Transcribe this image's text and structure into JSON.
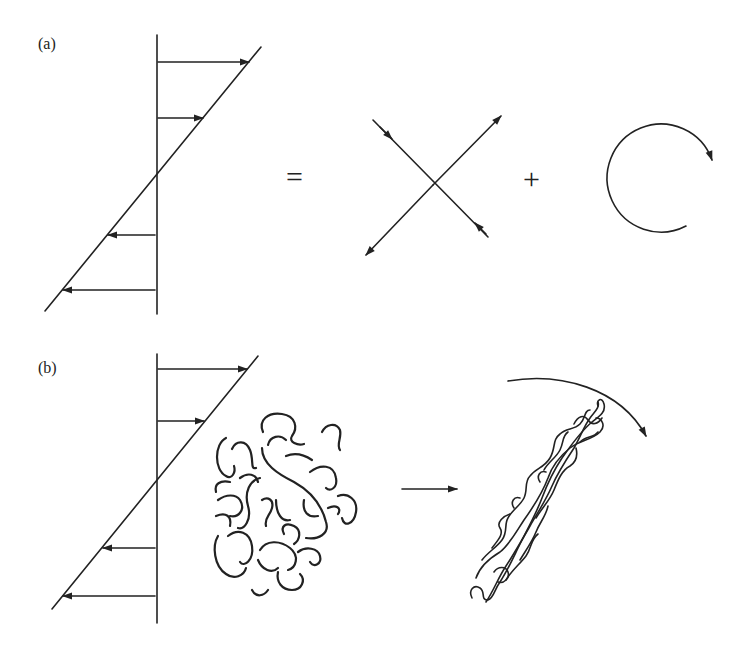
{
  "figure": {
    "panel_a": {
      "label": "(a)",
      "equals": "=",
      "plus": "+",
      "description": "Simple shear flow profile decomposed into pure extensional (straining) flow plus rotation",
      "shear_arrows": [
        {
          "direction": "right",
          "y": 62,
          "length": "long"
        },
        {
          "direction": "right",
          "y": 118,
          "length": "short"
        },
        {
          "direction": "left",
          "y": 235,
          "length": "short"
        },
        {
          "direction": "left",
          "y": 290,
          "length": "long"
        }
      ],
      "extension_arrows": "X-shaped: one axis inward-pointing (compression), one axis outward-pointing (extension)",
      "rotation": "clockwise circular arrow"
    },
    "panel_b": {
      "label": "(b)",
      "description": "Shear flow deforms random-coil polymer into stretched, rotated conformation",
      "shear_arrows": [
        {
          "direction": "right",
          "y": 369,
          "length": "long"
        },
        {
          "direction": "right",
          "y": 421,
          "length": "short"
        },
        {
          "direction": "left",
          "y": 548,
          "length": "short"
        },
        {
          "direction": "left",
          "y": 596,
          "length": "long"
        }
      ],
      "coil_state_before": "random coil",
      "transition_arrow": "right",
      "coil_state_after": "stretched, aligned coil",
      "rotation": "clockwise curved arrow"
    },
    "colors": {
      "ink": "#222222",
      "background": "#ffffff"
    }
  }
}
